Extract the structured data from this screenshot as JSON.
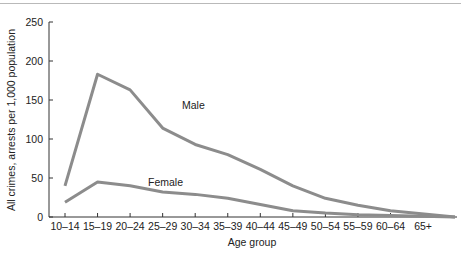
{
  "chart_data": {
    "type": "line",
    "title": "",
    "xlabel": "Age group",
    "ylabel": "All crimes, arrests per 1,000 population",
    "ylim": [
      0,
      250
    ],
    "yticks": [
      0,
      50,
      100,
      150,
      200,
      250
    ],
    "ytick_labels": [
      "0",
      "50",
      "100",
      "150",
      "200",
      "250"
    ],
    "categories": [
      "10–14",
      "15–19",
      "20–24",
      "25–29",
      "30–34",
      "35–39",
      "40–44",
      "45–49",
      "50–54",
      "55–59",
      "60–64",
      "65+"
    ],
    "grid": false,
    "legend": "inline labels",
    "series": [
      {
        "name": "Male",
        "values": [
          40,
          183,
          163,
          114,
          93,
          80,
          61,
          40,
          24,
          15,
          8,
          0
        ]
      },
      {
        "name": "Female",
        "values": [
          19,
          45,
          40,
          32,
          29,
          24,
          16,
          8,
          5,
          3,
          2,
          0
        ]
      }
    ],
    "annotations": [
      {
        "text": "Male",
        "near": "20–24 / 25–29"
      },
      {
        "text": "Female",
        "near": "25–29"
      }
    ],
    "line_color": "#8c8c8c"
  }
}
